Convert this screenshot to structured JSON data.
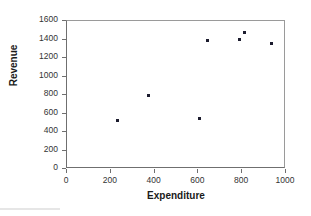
{
  "chart_data": {
    "type": "scatter",
    "title": "",
    "xlabel": "Expenditure",
    "ylabel": "Revenue",
    "xlim": [
      0,
      1000
    ],
    "ylim": [
      0,
      1600
    ],
    "xticks": [
      0,
      200,
      400,
      600,
      800,
      1000
    ],
    "yticks": [
      0,
      200,
      400,
      600,
      800,
      1000,
      1200,
      1400,
      1600
    ],
    "xtick_labels": [
      "0",
      "200",
      "400",
      "600",
      "800",
      "1000"
    ],
    "ytick_labels": [
      "0",
      "200",
      "400",
      "600",
      "800",
      "1000",
      "1200",
      "1400",
      "1600"
    ],
    "grid": false,
    "legend": null,
    "marker_color": "#1c1c2e",
    "axis_color": "#6f6f6f",
    "points": [
      {
        "x": 235,
        "y": 515
      },
      {
        "x": 375,
        "y": 785
      },
      {
        "x": 610,
        "y": 540
      },
      {
        "x": 645,
        "y": 1380
      },
      {
        "x": 790,
        "y": 1390
      },
      {
        "x": 815,
        "y": 1460
      },
      {
        "x": 940,
        "y": 1350
      }
    ]
  }
}
